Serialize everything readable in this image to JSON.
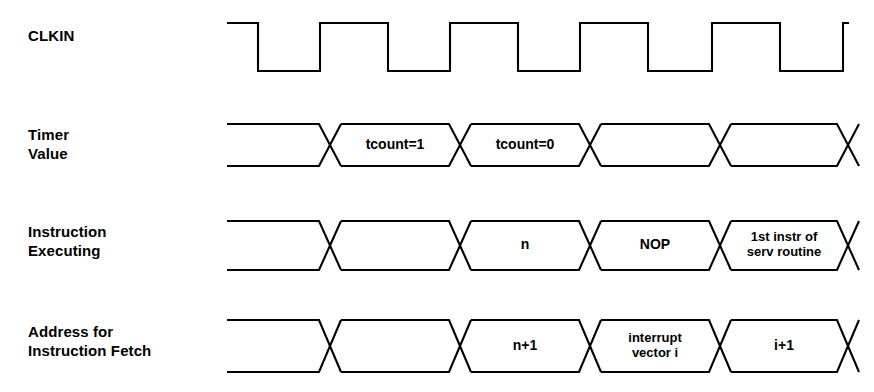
{
  "figure": {
    "type": "timing-diagram",
    "title": "",
    "background_color": "#ffffff",
    "line_color": "#000000",
    "width": 874,
    "height": 392
  },
  "geometry": {
    "wave_start_x": 227,
    "wave_end_x": 849,
    "crossings": [
      330,
      460,
      590,
      720,
      848
    ],
    "clock": {
      "high_y": 23,
      "low_y": 71,
      "edges": [
        258,
        320,
        388,
        450,
        518,
        580,
        648,
        712,
        780,
        843
      ]
    },
    "row_bounds": [
      {
        "top": 124,
        "bottom": 166
      },
      {
        "top": 221,
        "bottom": 270
      },
      {
        "top": 320,
        "bottom": 372
      }
    ]
  },
  "signals": [
    {
      "name": "CLKIN",
      "label_lines": [
        "CLKIN"
      ],
      "label_x": 28,
      "label_y": 26,
      "kind": "clock"
    },
    {
      "name": "Timer Value",
      "label_lines": [
        "Timer",
        "Value"
      ],
      "label_x": 28,
      "label_y": 125,
      "kind": "bus",
      "row": 0,
      "segments": [
        {
          "label": "",
          "lines": []
        },
        {
          "label": "tcount=1",
          "lines": [
            "tcount=1"
          ]
        },
        {
          "label": "tcount=0",
          "lines": [
            "tcount=0"
          ]
        },
        {
          "label": "",
          "lines": []
        },
        {
          "label": "",
          "lines": []
        }
      ]
    },
    {
      "name": "Instruction Executing",
      "label_lines": [
        "Instruction",
        "Executing"
      ],
      "label_x": 28,
      "label_y": 222,
      "kind": "bus",
      "row": 1,
      "segments": [
        {
          "label": "",
          "lines": []
        },
        {
          "label": "",
          "lines": []
        },
        {
          "label": "n",
          "lines": [
            "n"
          ]
        },
        {
          "label": "NOP",
          "lines": [
            "NOP"
          ]
        },
        {
          "label": "1st instr of serv routine",
          "lines": [
            "1st instr of",
            "serv routine"
          ]
        }
      ]
    },
    {
      "name": "Address for Instruction Fetch",
      "label_lines": [
        "Address for",
        "Instruction Fetch"
      ],
      "label_x": 28,
      "label_y": 322,
      "kind": "bus",
      "row": 2,
      "segments": [
        {
          "label": "",
          "lines": []
        },
        {
          "label": "",
          "lines": []
        },
        {
          "label": "n+1",
          "lines": [
            "n+1"
          ]
        },
        {
          "label": "interrupt vector i",
          "lines": [
            "interrupt",
            "vector i"
          ]
        },
        {
          "label": "i+1",
          "lines": [
            "i+1"
          ]
        }
      ]
    }
  ]
}
